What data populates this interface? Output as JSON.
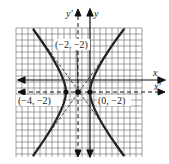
{
  "graph": {
    "type": "hyperbola",
    "grid": {
      "x_min": -14,
      "x_max": 7,
      "y_min": -15,
      "y_max": 13,
      "unit_px": 6
    },
    "axes": {
      "x_label": "x",
      "y_label": "y",
      "x_prime_label": "x′",
      "y_prime_label": "y′"
    },
    "points": [
      {
        "label": "(−4, −2)",
        "x": -4,
        "y": -2
      },
      {
        "label": "(−2, −2)",
        "x": -2,
        "y": -2
      },
      {
        "label": "(0, −2)",
        "x": 0,
        "y": -2
      }
    ],
    "center": {
      "x": -2,
      "y": -2
    },
    "vertices": [
      {
        "x": -4,
        "y": -2
      },
      {
        "x": 0,
        "y": -2
      }
    ],
    "colors": {
      "curve": "#222222",
      "grid": "#555555",
      "asymptote": "#333333"
    }
  }
}
